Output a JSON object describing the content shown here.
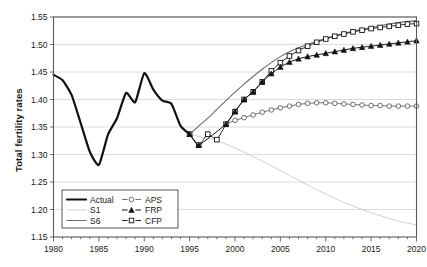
{
  "chart_data": {
    "type": "line",
    "title": "",
    "xlabel": "",
    "ylabel": "Total fertility rates",
    "xlim": [
      1980,
      2020
    ],
    "ylim": [
      1.15,
      1.55
    ],
    "xticks": [
      1980,
      1985,
      1990,
      1995,
      2000,
      2005,
      2010,
      2015,
      2020
    ],
    "yticks": [
      "1.15",
      "1.20",
      "1.25",
      "1.30",
      "1.35",
      "1.40",
      "1.45",
      "1.50",
      "1.55"
    ],
    "grid": "horizontal",
    "legend_position": "lower-left-inside",
    "series": [
      {
        "name": "Actual",
        "style": "thick-black-line",
        "marker": "none",
        "color": "#111111",
        "x": [
          1980,
          1981,
          1982,
          1983,
          1984,
          1985,
          1986,
          1987,
          1988,
          1989,
          1990,
          1991,
          1992,
          1993,
          1994,
          1995
        ],
        "values": [
          1.445,
          1.435,
          1.408,
          1.357,
          1.305,
          1.281,
          1.336,
          1.366,
          1.412,
          1.395,
          1.448,
          1.418,
          1.398,
          1.392,
          1.352,
          1.337
        ]
      },
      {
        "name": "S1",
        "style": "thin-light-gray-line",
        "marker": "none",
        "color": "#c8c8c8",
        "x": [
          1995,
          1998,
          2000,
          2003,
          2006,
          2009,
          2012,
          2015,
          2018,
          2020
        ],
        "values": [
          1.337,
          1.325,
          1.312,
          1.288,
          1.262,
          1.236,
          1.213,
          1.194,
          1.179,
          1.172
        ]
      },
      {
        "name": "S6",
        "style": "medium-gray-line",
        "marker": "none",
        "color": "#6b6b6b",
        "x": [
          1995,
          1997,
          1999,
          2001,
          2003,
          2005,
          2007,
          2009,
          2011,
          2013,
          2015,
          2017,
          2019,
          2020
        ],
        "values": [
          1.337,
          1.366,
          1.398,
          1.428,
          1.455,
          1.478,
          1.494,
          1.506,
          1.516,
          1.524,
          1.531,
          1.537,
          1.542,
          1.543
        ]
      },
      {
        "name": "APS",
        "style": "line-with-open-circles",
        "marker": "circle-open",
        "color": "#555555",
        "x": [
          1999,
          2000,
          2001,
          2002,
          2003,
          2004,
          2005,
          2006,
          2007,
          2008,
          2009,
          2010,
          2011,
          2012,
          2013,
          2014,
          2015,
          2016,
          2017,
          2018,
          2019,
          2020
        ],
        "values": [
          1.355,
          1.362,
          1.367,
          1.372,
          1.377,
          1.381,
          1.385,
          1.388,
          1.391,
          1.393,
          1.394,
          1.394,
          1.393,
          1.392,
          1.391,
          1.39,
          1.389,
          1.389,
          1.388,
          1.388,
          1.388,
          1.388
        ]
      },
      {
        "name": "FRP",
        "style": "line-with-filled-triangles",
        "marker": "triangle-filled",
        "color": "#111111",
        "x": [
          1995,
          1996,
          1999,
          2000,
          2001,
          2002,
          2003,
          2004,
          2005,
          2006,
          2007,
          2008,
          2009,
          2010,
          2011,
          2012,
          2013,
          2014,
          2015,
          2016,
          2017,
          2018,
          2019,
          2020
        ],
        "values": [
          1.337,
          1.317,
          1.355,
          1.378,
          1.4,
          1.414,
          1.432,
          1.447,
          1.459,
          1.468,
          1.474,
          1.478,
          1.481,
          1.484,
          1.487,
          1.49,
          1.493,
          1.495,
          1.497,
          1.499,
          1.501,
          1.503,
          1.505,
          1.507
        ]
      },
      {
        "name": "CFP",
        "style": "line-with-open-squares",
        "marker": "square-open",
        "color": "#111111",
        "x": [
          1995,
          1996,
          1997,
          1998,
          1999,
          2000,
          2001,
          2002,
          2003,
          2004,
          2005,
          2006,
          2007,
          2008,
          2009,
          2010,
          2011,
          2012,
          2013,
          2014,
          2015,
          2016,
          2017,
          2018,
          2019,
          2020
        ],
        "values": [
          1.337,
          1.317,
          1.337,
          1.327,
          1.355,
          1.378,
          1.4,
          1.414,
          1.432,
          1.452,
          1.467,
          1.479,
          1.489,
          1.497,
          1.504,
          1.51,
          1.515,
          1.519,
          1.523,
          1.526,
          1.529,
          1.531,
          1.533,
          1.535,
          1.537,
          1.538
        ]
      }
    ],
    "legend": [
      {
        "label": "Actual",
        "marker": "none",
        "style": "thick-black-line",
        "color": "#111111"
      },
      {
        "label": "S1",
        "marker": "none",
        "style": "thin-light-gray-line",
        "color": "#c8c8c8"
      },
      {
        "label": "S6",
        "marker": "none",
        "style": "medium-gray-line",
        "color": "#6b6b6b"
      },
      {
        "label": "APS",
        "marker": "circle-open",
        "style": "line-with-open-circles",
        "color": "#555555"
      },
      {
        "label": "FRP",
        "marker": "triangle-filled",
        "style": "line-with-filled-triangles",
        "color": "#111111"
      },
      {
        "label": "CFP",
        "marker": "square-open",
        "style": "line-with-open-squares",
        "color": "#111111"
      }
    ],
    "colors": {
      "axis": "#5a5a5a",
      "grid": "#d8d8d8",
      "text": "#1a1a1a",
      "background": "#ffffff"
    }
  }
}
